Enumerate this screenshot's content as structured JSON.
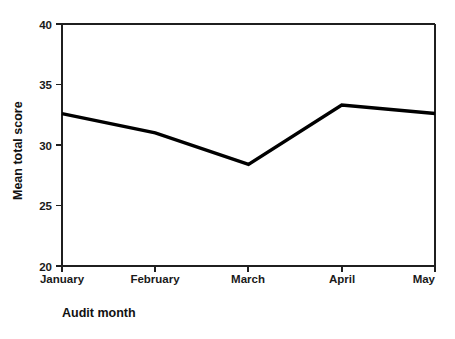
{
  "chart_data": {
    "type": "line",
    "title": "",
    "subtitle": "",
    "xlabel": "Audit month",
    "ylabel": "Mean total score",
    "categories": [
      "January",
      "February",
      "March",
      "April",
      "May"
    ],
    "values": [
      32.6,
      31.0,
      28.4,
      33.3,
      32.6
    ],
    "series": [
      {
        "name": "Mean total score",
        "values": [
          32.6,
          31.0,
          28.4,
          33.3,
          32.6
        ],
        "color": "#000000"
      }
    ],
    "ylim": [
      20,
      40
    ],
    "yticks": [
      20,
      25,
      30,
      35,
      40
    ],
    "ytick_labels": [
      "20",
      "25",
      "30",
      "35",
      "40"
    ],
    "xticks": [
      "January",
      "February",
      "March",
      "April",
      "May"
    ],
    "grid": false,
    "legend": false,
    "legend_position": "none",
    "line_color": "#000000",
    "axis_color": "#1f1f1f",
    "background": "#ffffff"
  },
  "axes": {
    "y_title": "Mean total score",
    "x_title": "Audit month"
  }
}
